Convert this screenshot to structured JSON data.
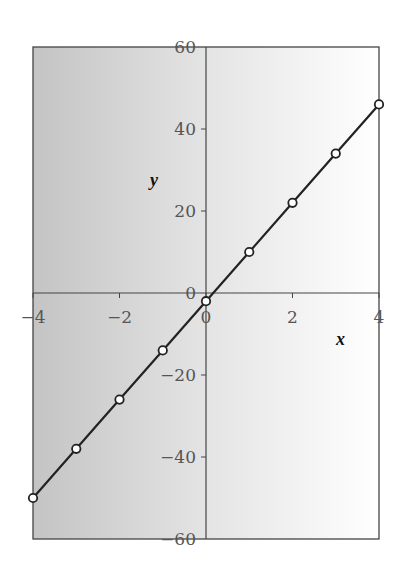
{
  "chart_data": {
    "type": "line",
    "title": "",
    "xlabel": "x",
    "ylabel": "y",
    "xlim": [
      -4,
      4
    ],
    "ylim": [
      -60,
      60
    ],
    "x_ticks": [
      -4,
      -2,
      0,
      2,
      4
    ],
    "y_ticks": [
      -60,
      -40,
      -20,
      0,
      20,
      40,
      60
    ],
    "x_tick_labels": [
      "−4",
      "−2",
      "0",
      "2",
      "4"
    ],
    "y_tick_labels": [
      "−60",
      "−40",
      "−20",
      "0",
      "20",
      "40",
      "60"
    ],
    "grid": false,
    "legend": null,
    "series": [
      {
        "name": "y = 12x − 2",
        "marker": "open-circle",
        "x": [
          -4,
          -3,
          -2,
          -1,
          0,
          1,
          2,
          3,
          4
        ],
        "y": [
          -50,
          -38,
          -26,
          -14,
          -2,
          10,
          22,
          34,
          46
        ]
      }
    ],
    "style": {
      "left_panel_color": "#c9c9c9",
      "right_panel_color": "#ffffff",
      "line_color": "#222222"
    }
  }
}
